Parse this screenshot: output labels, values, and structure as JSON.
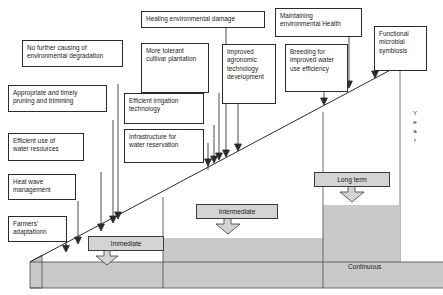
{
  "diagram": {
    "axis_label_vertical": "Year",
    "axis_letters": [
      "Y",
      "e",
      "a",
      "r"
    ],
    "baseline_label": "Continuous",
    "colors": {
      "band_fill": "#c9c9c9",
      "step_fill": "#c9c9c9",
      "tag_fill": "#d4d4d4",
      "line": "#2b2b2b",
      "box_fill": "#ffffff",
      "page_bg": "#ffffff"
    }
  },
  "phase_tags": [
    {
      "id": "immediate",
      "label": "Immediate"
    },
    {
      "id": "intermediate",
      "label": "Intermediate"
    },
    {
      "id": "long-term",
      "label": "Long term"
    }
  ],
  "strategy_boxes": [
    {
      "id": "no-further-causing",
      "line1": "No further causing of",
      "line2": "environmental degradation",
      "line3": ""
    },
    {
      "id": "appropriate-pruning",
      "line1": "Appropriate and timely",
      "line2": "pruning and trimming",
      "line3": ""
    },
    {
      "id": "efficient-water-use",
      "line1": "Efficient use of",
      "line2": "water resources",
      "line3": ""
    },
    {
      "id": "heat-wave-management",
      "line1": "Heat wave",
      "line2": "management",
      "line3": ""
    },
    {
      "id": "farmers-adaptation",
      "line1": "Farmers'",
      "line2": "adaptationn",
      "line3": ""
    },
    {
      "id": "healing-env-damage",
      "line1": "Healing environmental damage",
      "line2": "",
      "line3": ""
    },
    {
      "id": "more-tolerant-cultivar",
      "line1": "More tolerant",
      "line2": "cultivar plantation",
      "line3": ""
    },
    {
      "id": "efficient-irrigation",
      "line1": "Efficient irrigation",
      "line2": "technology",
      "line3": ""
    },
    {
      "id": "infrastructure-reservation",
      "line1": "Infrastructure for",
      "line2": "water reservation",
      "line3": ""
    },
    {
      "id": "improved-agronomic",
      "line1": "Improved",
      "line2": "agronomic",
      "line3": "technology",
      "line4": "development"
    },
    {
      "id": "maintaining-env-health",
      "line1": "Maintaining",
      "line2": "environmental Health",
      "line3": ""
    },
    {
      "id": "breeding-water-efficiency",
      "line1": "Breeding for",
      "line2": "improved water",
      "line3": "use efficiency"
    },
    {
      "id": "functional-microbial",
      "line1": "Functional",
      "line2": "microbial",
      "line3": "symbiosis"
    }
  ]
}
